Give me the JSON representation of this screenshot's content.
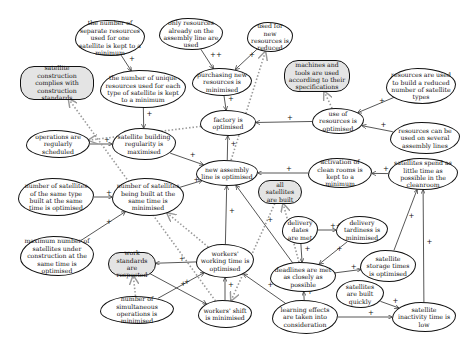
{
  "diagram": {
    "type": "goal-influence-graph",
    "nodes": [
      {
        "id": "n1",
        "label": "the number of separate resources used for one satellite is kept to a minimum",
        "kind": "cloud",
        "x": 75,
        "y": 20,
        "w": 70,
        "h": 36
      },
      {
        "id": "n2",
        "label": "only resources already on the assembly line are used",
        "kind": "cloud",
        "x": 159,
        "y": 18,
        "w": 64,
        "h": 32
      },
      {
        "id": "n3",
        "label": "used for new resources is reduced",
        "kind": "cloud",
        "x": 247,
        "y": 22,
        "w": 46,
        "h": 30
      },
      {
        "id": "n4",
        "label": "satellite construction complies with construction standards",
        "kind": "goal",
        "x": 20,
        "y": 66,
        "w": 74,
        "h": 34
      },
      {
        "id": "n5",
        "label": "the number of unique resources used for each type of satellite is kept to a minimum",
        "kind": "cloud",
        "x": 100,
        "y": 70,
        "w": 86,
        "h": 38
      },
      {
        "id": "n6",
        "label": "purchasing new resources is minimised",
        "kind": "cloud",
        "x": 192,
        "y": 68,
        "w": 60,
        "h": 28
      },
      {
        "id": "n7",
        "label": "machines and tools are used according to their specifications",
        "kind": "goal",
        "x": 284,
        "y": 60,
        "w": 66,
        "h": 32
      },
      {
        "id": "n8",
        "label": "resources are used to build a reduced number of satellite types",
        "kind": "cloud",
        "x": 386,
        "y": 68,
        "w": 70,
        "h": 36
      },
      {
        "id": "n9",
        "label": "factory is optimised",
        "kind": "cloud",
        "x": 200,
        "y": 110,
        "w": 56,
        "h": 26
      },
      {
        "id": "n10",
        "label": "use of resources is optimised",
        "kind": "cloud",
        "x": 312,
        "y": 108,
        "w": 52,
        "h": 26
      },
      {
        "id": "n11",
        "label": "resources can be used on several assembly lines",
        "kind": "cloud",
        "x": 390,
        "y": 122,
        "w": 70,
        "h": 32
      },
      {
        "id": "n12",
        "label": "operations are regularly scheduled",
        "kind": "cloud",
        "x": 26,
        "y": 130,
        "w": 64,
        "h": 28
      },
      {
        "id": "n13",
        "label": "satellite building regularity is maximised",
        "kind": "cloud",
        "x": 112,
        "y": 128,
        "w": 64,
        "h": 32
      },
      {
        "id": "n14",
        "label": "new assembly line is optimised",
        "kind": "cloud",
        "x": 196,
        "y": 160,
        "w": 62,
        "h": 26
      },
      {
        "id": "n15",
        "label": "activation of clean rooms is kept to a minimum",
        "kind": "cloud",
        "x": 308,
        "y": 158,
        "w": 64,
        "h": 30
      },
      {
        "id": "n16",
        "label": "satellites spend as little time as possible in the cleanroom",
        "kind": "cloud",
        "x": 388,
        "y": 158,
        "w": 70,
        "h": 32
      },
      {
        "id": "n17",
        "label": "all satellites are built",
        "kind": "goal",
        "x": 258,
        "y": 180,
        "w": 44,
        "h": 24
      },
      {
        "id": "n18",
        "label": "number of satellites of the same type built at the same time is optimised",
        "kind": "cloud",
        "x": 18,
        "y": 178,
        "w": 76,
        "h": 38
      },
      {
        "id": "n19",
        "label": "number of satellites being built at the same time is minimised",
        "kind": "cloud",
        "x": 112,
        "y": 178,
        "w": 72,
        "h": 38
      },
      {
        "id": "n20",
        "label": "delivery dates are met",
        "kind": "cloud",
        "x": 282,
        "y": 216,
        "w": 36,
        "h": 28
      },
      {
        "id": "n21",
        "label": "delivery tardiness is minimised",
        "kind": "cloud",
        "x": 336,
        "y": 216,
        "w": 52,
        "h": 28
      },
      {
        "id": "n22",
        "label": "maximum number of satellites under construction at the same time is optimised",
        "kind": "cloud",
        "x": 20,
        "y": 236,
        "w": 74,
        "h": 40
      },
      {
        "id": "n23",
        "label": "work standards are respected",
        "kind": "goal",
        "x": 108,
        "y": 252,
        "w": 48,
        "h": 24
      },
      {
        "id": "n24",
        "label": "workers' working time is optimised",
        "kind": "cloud",
        "x": 196,
        "y": 244,
        "w": 58,
        "h": 34
      },
      {
        "id": "n25",
        "label": "deadlines are met as closely as possible",
        "kind": "cloud",
        "x": 270,
        "y": 262,
        "w": 66,
        "h": 30
      },
      {
        "id": "n26",
        "label": "satellite storage times is optimised",
        "kind": "cloud",
        "x": 360,
        "y": 250,
        "w": 56,
        "h": 32
      },
      {
        "id": "n27",
        "label": "satellites are built quickly",
        "kind": "cloud",
        "x": 336,
        "y": 280,
        "w": 48,
        "h": 28
      },
      {
        "id": "n28",
        "label": "number of simultaneous operations is minimised",
        "kind": "cloud",
        "x": 100,
        "y": 296,
        "w": 74,
        "h": 28
      },
      {
        "id": "n29",
        "label": "workers' shift is minimised",
        "kind": "cloud",
        "x": 198,
        "y": 300,
        "w": 54,
        "h": 28
      },
      {
        "id": "n30",
        "label": "learning effects are taken into consideration",
        "kind": "cloud",
        "x": 272,
        "y": 300,
        "w": 66,
        "h": 34
      },
      {
        "id": "n31",
        "label": "satellite inactivity time is low",
        "kind": "cloud",
        "x": 392,
        "y": 302,
        "w": 64,
        "h": 30
      }
    ],
    "edges": [
      {
        "from": "n1",
        "to": "n5",
        "sign": "+",
        "style": "solid"
      },
      {
        "from": "n2",
        "to": "n6",
        "sign": "++",
        "style": "solid"
      },
      {
        "from": "n3",
        "to": "n6",
        "sign": "+",
        "style": "solid"
      },
      {
        "from": "n5",
        "to": "n13",
        "sign": "+",
        "style": "solid"
      },
      {
        "from": "n6",
        "to": "n9",
        "sign": "+",
        "style": "solid"
      },
      {
        "from": "n8",
        "to": "n10",
        "sign": "+",
        "style": "solid"
      },
      {
        "from": "n11",
        "to": "n10",
        "sign": "+",
        "style": "solid"
      },
      {
        "from": "n10",
        "to": "n9",
        "sign": "+",
        "style": "solid"
      },
      {
        "from": "n12",
        "to": "n13",
        "sign": "+",
        "style": "solid"
      },
      {
        "from": "n13",
        "to": "n14",
        "sign": "+",
        "style": "solid"
      },
      {
        "from": "n14",
        "to": "n9",
        "sign": "+",
        "style": "solid"
      },
      {
        "from": "n15",
        "to": "n14",
        "sign": "+",
        "style": "solid"
      },
      {
        "from": "n16",
        "to": "n15",
        "sign": "+",
        "style": "solid"
      },
      {
        "from": "n18",
        "to": "n19",
        "sign": "+",
        "style": "solid"
      },
      {
        "from": "n19",
        "to": "n14",
        "sign": "+",
        "style": "solid"
      },
      {
        "from": "n22",
        "to": "n19",
        "sign": "+",
        "style": "solid"
      },
      {
        "from": "n24",
        "to": "n14",
        "sign": "+",
        "style": "solid"
      },
      {
        "from": "n24",
        "to": "n23",
        "sign": "+",
        "style": "solid"
      },
      {
        "from": "n25",
        "to": "n14",
        "sign": "+",
        "style": "solid"
      },
      {
        "from": "n20",
        "to": "n25",
        "sign": "+",
        "style": "solid"
      },
      {
        "from": "n20",
        "to": "n21",
        "sign": "++",
        "style": "solid"
      },
      {
        "from": "n21",
        "to": "n25",
        "sign": "+",
        "style": "solid"
      },
      {
        "from": "n25",
        "to": "n26",
        "sign": "+",
        "style": "solid"
      },
      {
        "from": "n26",
        "to": "n16",
        "sign": "+",
        "style": "solid"
      },
      {
        "from": "n31",
        "to": "n16",
        "sign": "+",
        "style": "solid"
      },
      {
        "from": "n27",
        "to": "n31",
        "sign": "+",
        "style": "solid"
      },
      {
        "from": "n30",
        "to": "n25",
        "sign": "+",
        "style": "solid"
      },
      {
        "from": "n30",
        "to": "n31",
        "sign": "+",
        "style": "solid"
      },
      {
        "from": "n30",
        "to": "n24",
        "sign": "+",
        "style": "solid"
      },
      {
        "from": "n28",
        "to": "n24",
        "sign": "+",
        "style": "solid"
      },
      {
        "from": "n29",
        "to": "n24",
        "sign": "+",
        "style": "solid"
      },
      {
        "from": "n23",
        "to": "n29",
        "sign": "+",
        "style": "solid"
      },
      {
        "from": "n14",
        "to": "n3",
        "sign": "",
        "style": "dashed"
      },
      {
        "from": "n10",
        "to": "n7",
        "sign": "",
        "style": "dashed"
      },
      {
        "from": "n9",
        "to": "n12",
        "sign": "",
        "style": "dashed"
      },
      {
        "from": "n29",
        "to": "n4",
        "sign": "",
        "style": "dashed"
      },
      {
        "from": "n28",
        "to": "n23",
        "sign": "",
        "style": "dashed"
      },
      {
        "from": "n25",
        "to": "n17",
        "sign": "",
        "style": "dashed"
      },
      {
        "from": "n24",
        "to": "n19",
        "sign": "",
        "style": "dashed"
      },
      {
        "from": "n17",
        "to": "n29",
        "sign": "",
        "style": "dashed"
      }
    ]
  }
}
